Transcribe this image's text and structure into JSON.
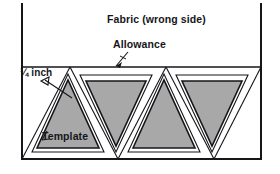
{
  "figure": {
    "kind": "sewing-template-layout-diagram",
    "labels": {
      "fabric": "Fabric (wrong side)",
      "allowance": "Allowance",
      "seam_width": "¼ inch",
      "template": "Template"
    },
    "colors": {
      "template_fill": "#a8a8a8",
      "fabric_fill": "#ffffff",
      "ink": "#16161a",
      "background": "#ffffff"
    },
    "fabric_panel": {
      "left_edge_x": 21,
      "right_edge_x": 262,
      "top_y": 3,
      "bottom_y": 160,
      "allowance_band_top_y": 67
    },
    "triangles": [
      {
        "index": 1,
        "orientation": "up",
        "label": "Template"
      },
      {
        "index": 2,
        "orientation": "down",
        "label": ""
      },
      {
        "index": 3,
        "orientation": "up",
        "label": ""
      },
      {
        "index": 4,
        "orientation": "down",
        "label": ""
      }
    ],
    "annotations": [
      {
        "name": "allowance-leader",
        "from": "Allowance",
        "points_to": "allowance-band-top-edge"
      },
      {
        "name": "seam-width-leader",
        "from": "¼ inch",
        "points_to": "gap-between-cut-line-and-template"
      },
      {
        "name": "template-leader",
        "from": "Template",
        "points_to": "gray-template-triangle"
      }
    ]
  }
}
